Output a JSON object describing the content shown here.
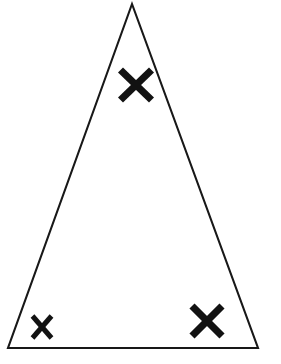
{
  "figure": {
    "title": "Isosceles triangle with three angle marks",
    "canvas": {
      "width": 281,
      "height": 364,
      "background_color": "#ffffff"
    },
    "shape": {
      "name": "triangle",
      "type": "isosceles",
      "filled": false,
      "stroke_color": "#181818",
      "stroke_width": 2.1,
      "vertices": [
        {
          "label": "apex",
          "x": 132,
          "y": 4
        },
        {
          "label": "bottom-left",
          "x": 8,
          "y": 348
        },
        {
          "label": "bottom-right",
          "x": 258,
          "y": 348
        }
      ]
    },
    "marks": [
      {
        "label": "X",
        "name": "apex-angle-mark",
        "position": "apex",
        "center_x": 136,
        "center_y": 85,
        "half_width": 15.5,
        "half_height": 15,
        "stroke_width": 7.2,
        "color": "#121212"
      },
      {
        "label": "X",
        "name": "bottom-left-angle-mark",
        "position": "bottom-left",
        "center_x": 42,
        "center_y": 327,
        "half_width": 9.5,
        "half_height": 11,
        "stroke_width": 5.0,
        "color": "#121212"
      },
      {
        "label": "X",
        "name": "bottom-right-angle-mark",
        "position": "bottom-right",
        "center_x": 207,
        "center_y": 321,
        "half_width": 15,
        "half_height": 15,
        "stroke_width": 7.2,
        "color": "#121212"
      }
    ]
  }
}
